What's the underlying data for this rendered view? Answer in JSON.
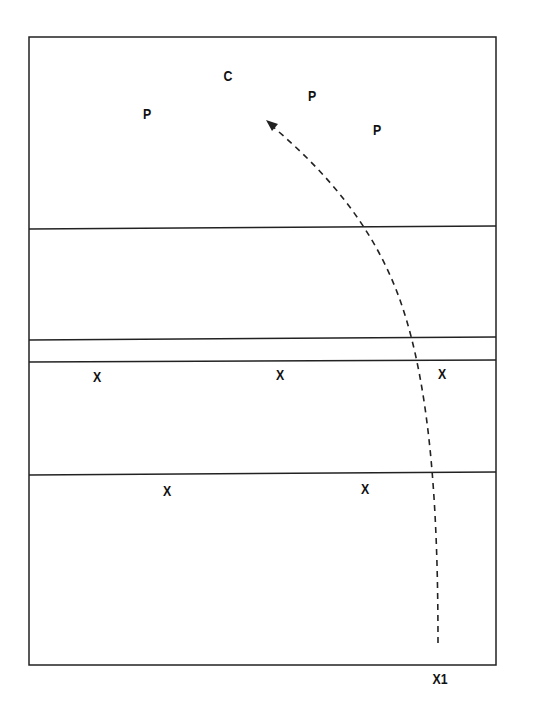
{
  "diagram": {
    "type": "play-diagram",
    "colors": {
      "line": "#222222",
      "text": "#111111",
      "background": "#ffffff"
    },
    "field": {
      "left": 29,
      "top": 37,
      "right": 496,
      "bottom": 665
    },
    "lines": [
      {
        "name": "line-1",
        "y_left": 229,
        "y_right": 226
      },
      {
        "name": "line-2",
        "y_left": 340,
        "y_right": 337
      },
      {
        "name": "line-3",
        "y_left": 362,
        "y_right": 360
      },
      {
        "name": "line-4",
        "y_left": 475,
        "y_right": 472
      }
    ],
    "players": [
      {
        "label": "C",
        "x": 228,
        "y": 75
      },
      {
        "label": "P",
        "x": 147,
        "y": 113
      },
      {
        "label": "P",
        "x": 312,
        "y": 95
      },
      {
        "label": "P",
        "x": 377,
        "y": 129
      },
      {
        "label": "X",
        "x": 97,
        "y": 376
      },
      {
        "label": "X",
        "x": 280,
        "y": 374
      },
      {
        "label": "X",
        "x": 442,
        "y": 373
      },
      {
        "label": "X",
        "x": 167,
        "y": 490
      },
      {
        "label": "X",
        "x": 365,
        "y": 488
      },
      {
        "label": "X1",
        "x": 440,
        "y": 678
      }
    ],
    "route": {
      "style": "dashed",
      "from": {
        "x": 438,
        "y": 643
      },
      "to": {
        "x": 268,
        "y": 122
      },
      "arrowhead": "end"
    }
  }
}
